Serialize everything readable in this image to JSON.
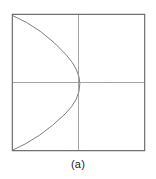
{
  "figure": {
    "caption": "(a)",
    "title": "",
    "frame": {
      "border_color": "#6e6e6e",
      "background_color": "#ffffff",
      "left": 11,
      "top": 13,
      "width": 135,
      "height": 139
    }
  },
  "chart_data": {
    "type": "line",
    "title": "",
    "subtitle": "",
    "xlabel": "",
    "ylabel": "",
    "xlim": [
      -1,
      1
    ],
    "ylim": [
      -1,
      1
    ],
    "grid": false,
    "legend": null,
    "legend_position": "none",
    "annotations": [
      "(a)"
    ],
    "curve_color": "#6b6b6b",
    "axis_color": "#8a8a8a",
    "families": [
      {
        "name": "equipotential-family",
        "level_parameter": "u",
        "levels": [
          -0.875,
          -0.75,
          -0.625,
          -0.5,
          -0.375,
          -0.25,
          -0.125,
          0.0,
          0.125,
          0.25,
          0.375,
          0.5,
          0.625,
          0.75,
          0.875
        ],
        "relation": "x*y = const (rotated hyperbolae)"
      },
      {
        "name": "streamline-family",
        "level_parameter": "v",
        "levels": [
          -0.875,
          -0.75,
          -0.625,
          -0.5,
          -0.375,
          -0.25,
          -0.125,
          0.0,
          0.125,
          0.25,
          0.375,
          0.5,
          0.625,
          0.75,
          0.875
        ],
        "relation": "x^2 - y^2 = const (rotated hyperbolae)"
      }
    ],
    "critical_points": [
      {
        "name": "saddle-center",
        "x": 0.0,
        "y": 0.0
      },
      {
        "name": "cusp-left",
        "x": -1.0,
        "y": 0.0
      },
      {
        "name": "cusp-right",
        "x": 1.0,
        "y": 0.0
      },
      {
        "name": "cusp-top",
        "x": 0.0,
        "y": 1.0
      },
      {
        "name": "cusp-bottom",
        "x": 0.0,
        "y": -1.0
      }
    ],
    "axes_lines": [
      {
        "name": "horizontal-axis",
        "from": [
          -1,
          0
        ],
        "to": [
          1,
          0
        ]
      },
      {
        "name": "vertical-axis",
        "from": [
          0,
          -1
        ],
        "to": [
          0,
          1
        ]
      }
    ]
  }
}
